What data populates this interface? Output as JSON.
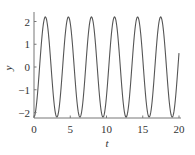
{
  "chart_data": {
    "type": "line",
    "title": "",
    "xlabel": "t",
    "ylabel": "y",
    "xlim": [
      0,
      20
    ],
    "ylim": [
      -2.4,
      2.4
    ],
    "xticks": [
      0,
      5,
      10,
      15,
      20
    ],
    "xtick_labels": [
      "0",
      "5",
      "10",
      "15",
      "20"
    ],
    "yticks": [
      -2,
      -1,
      0,
      1,
      2
    ],
    "ytick_labels": [
      "−2",
      "−1",
      "0",
      "1",
      "2"
    ],
    "grid": false,
    "legend": null,
    "series": [
      {
        "name": "y(t)",
        "color": "#555555",
        "description": "sinusoid, amplitude ≈ 2.2, period ≈ 3.18 (≈ 6.3 cycles over 0–20), starts at trough ≈ −2.2, ends ≈ 0.6",
        "function": {
          "amplitude": 2.2,
          "omega": 1.975,
          "phase": -1.52
        },
        "x": [
          0,
          0.1,
          1.7,
          3.3,
          4.9,
          6.5,
          8.0,
          9.6,
          11.2,
          12.8,
          14.4,
          15.9,
          17.5,
          19.1,
          20
        ],
        "values": [
          -2.2,
          -2.2,
          2.2,
          -2.2,
          2.2,
          -2.2,
          2.2,
          -2.2,
          2.2,
          -2.2,
          2.2,
          -2.2,
          2.2,
          -2.2,
          0.6
        ]
      }
    ]
  }
}
